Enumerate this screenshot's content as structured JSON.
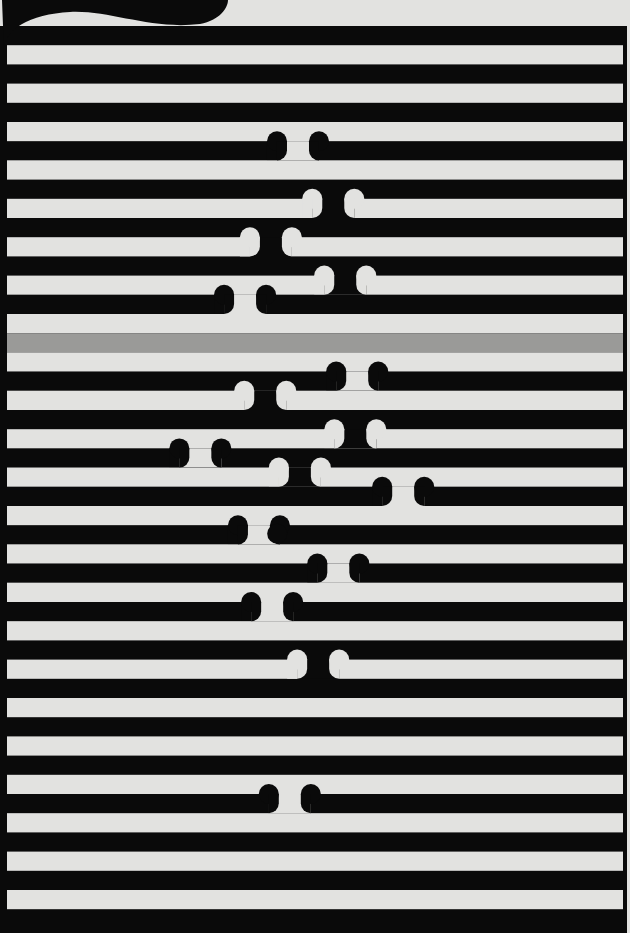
{
  "artwork": {
    "title": "",
    "colors": {
      "paper": "#e2e2e0",
      "ink": "#0a0a0a",
      "band": "#9a9a98"
    },
    "stripe_count": 47,
    "band_stripe_index": 16,
    "breaks": [
      {
        "stripe": 6,
        "ink": "black",
        "x": 0.473
      },
      {
        "stripe": 9,
        "ink": "white",
        "x": 0.529
      },
      {
        "stripe": 11,
        "ink": "white",
        "x": 0.43
      },
      {
        "stripe": 13,
        "ink": "white",
        "x": 0.548
      },
      {
        "stripe": 14,
        "ink": "black",
        "x": 0.389
      },
      {
        "stripe": 18,
        "ink": "black",
        "x": 0.567
      },
      {
        "stripe": 19,
        "ink": "white",
        "x": 0.421
      },
      {
        "stripe": 21,
        "ink": "white",
        "x": 0.564
      },
      {
        "stripe": 22,
        "ink": "black",
        "x": 0.318
      },
      {
        "stripe": 23,
        "ink": "white",
        "x": 0.476
      },
      {
        "stripe": 24,
        "ink": "black",
        "x": 0.64
      },
      {
        "stripe": 26,
        "ink": "black",
        "x": 0.411,
        "dot": 0.44
      },
      {
        "stripe": 28,
        "ink": "black",
        "x": 0.537
      },
      {
        "stripe": 30,
        "ink": "black",
        "x": 0.432
      },
      {
        "stripe": 33,
        "ink": "white",
        "x": 0.505
      },
      {
        "stripe": 40,
        "ink": "black",
        "x": 0.46
      }
    ]
  }
}
